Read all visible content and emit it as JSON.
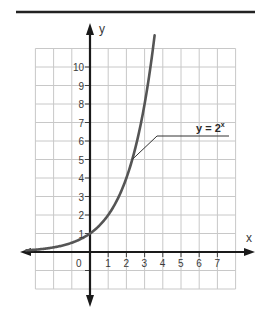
{
  "chart_data": {
    "type": "line",
    "title": "",
    "xlabel": "x",
    "ylabel": "y",
    "xlim": [
      -3,
      8
    ],
    "ylim": [
      -2,
      11
    ],
    "grid": true,
    "x_tick_labels": [
      "0",
      "1",
      "2",
      "3",
      "4",
      "5",
      "6",
      "7"
    ],
    "x_tick_values": [
      0,
      1,
      2,
      3,
      4,
      5,
      6,
      7
    ],
    "y_tick_labels": [
      "1",
      "2",
      "3",
      "4",
      "5",
      "6",
      "7",
      "8",
      "9",
      "10"
    ],
    "y_tick_values": [
      1,
      2,
      3,
      4,
      5,
      6,
      7,
      8,
      9,
      10
    ],
    "series": [
      {
        "name": "y = 2^x",
        "function": "2^x",
        "x_range": [
          -3.5,
          3.55
        ],
        "points": [
          {
            "x": -3,
            "y": 0.125
          },
          {
            "x": -2,
            "y": 0.25
          },
          {
            "x": -1,
            "y": 0.5
          },
          {
            "x": 0,
            "y": 1
          },
          {
            "x": 1,
            "y": 2
          },
          {
            "x": 2,
            "y": 4
          },
          {
            "x": 2.32,
            "y": 5
          },
          {
            "x": 3,
            "y": 8
          },
          {
            "x": 3.46,
            "y": 11
          }
        ]
      }
    ],
    "annotations": [
      {
        "text": "y = 2",
        "superscript": "x",
        "points_to": {
          "x": 2.32,
          "y": 5
        }
      }
    ]
  },
  "colors": {
    "grid": "#c8c8c8",
    "axis": "#1a1a1a",
    "curve": "#555555",
    "rule": "#222222"
  }
}
